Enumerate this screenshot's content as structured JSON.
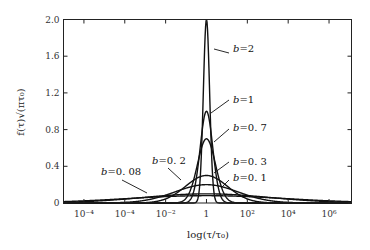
{
  "chart_data": {
    "type": "line",
    "title": "",
    "xlabel": "log(τ/τ₀)",
    "ylabel": "f(τ)√(πτ₀)",
    "x_scale": "log10",
    "xlim_log10": [
      -7,
      7.1
    ],
    "ylim": [
      0,
      2.0
    ],
    "grid": false,
    "legend": "inline curve labels",
    "x_ticks": [
      {
        "pos": -6,
        "label": "10⁻⁶",
        "shown_as": "10⁻⁴"
      },
      {
        "pos": -4,
        "label": "10⁻⁴"
      },
      {
        "pos": -2,
        "label": "10⁻²"
      },
      {
        "pos": 0,
        "label": "1"
      },
      {
        "pos": 2,
        "label": "10²"
      },
      {
        "pos": 4,
        "label": "10⁴"
      },
      {
        "pos": 6,
        "label": "10⁶"
      }
    ],
    "y_ticks": [
      {
        "value": 0,
        "label": "0"
      },
      {
        "value": 0.4,
        "label": "0.4"
      },
      {
        "value": 0.8,
        "label": "0.8"
      },
      {
        "value": 1.2,
        "label": "1.2"
      },
      {
        "value": 1.6,
        "label": "1.6"
      },
      {
        "value": 2.0,
        "label": "2.0"
      }
    ],
    "formula": "y = b * exp(-(b * ln(τ/τ₀))^2)",
    "series": [
      {
        "name": "b=2",
        "b": 2,
        "peak": 2.0,
        "label": "b=2",
        "label_pos": [
          233,
          52
        ],
        "leader": [
          [
            214,
            49
          ],
          [
            229,
            53
          ]
        ]
      },
      {
        "name": "b=1",
        "b": 1,
        "peak": 1.0,
        "label": "b=1",
        "label_pos": [
          233,
          103
        ],
        "leader": [
          [
            211,
            113
          ],
          [
            229,
            100
          ]
        ]
      },
      {
        "name": "b=0.7",
        "b": 0.7,
        "peak": 0.7,
        "label": "b=0.7",
        "label_pos": [
          233,
          131
        ],
        "leader": [
          [
            214,
            142
          ],
          [
            229,
            129
          ]
        ]
      },
      {
        "name": "b=0.3",
        "b": 0.3,
        "peak": 0.3,
        "label": "b=0.3",
        "label_pos": [
          233,
          165
        ],
        "leader": [
          [
            214,
            173
          ],
          [
            229,
            162
          ]
        ]
      },
      {
        "name": "b=0.2",
        "b": 0.2,
        "peak": 0.2,
        "label": "b=0.2",
        "label_pos": [
          152,
          164
        ],
        "leader": [
          [
            181,
            180
          ],
          [
            168,
            168
          ]
        ]
      },
      {
        "name": "b=0.1",
        "b": 0.1,
        "peak": 0.1,
        "label": "b=0.1",
        "label_pos": [
          233,
          181
        ],
        "leader": [
          [
            222,
            187
          ],
          [
            229,
            180
          ]
        ]
      },
      {
        "name": "b=0.08",
        "b": 0.08,
        "peak": 0.08,
        "label": "b=0.08",
        "label_pos": [
          101,
          175
        ],
        "leader": [
          [
            122,
            180
          ],
          [
            147,
            193
          ]
        ]
      }
    ]
  }
}
